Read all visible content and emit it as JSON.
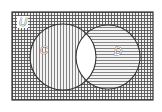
{
  "diagram": {
    "type": "venn",
    "universe_label": "U",
    "sets": [
      {
        "label": "C",
        "pattern": "vertical-lines"
      },
      {
        "label": "D",
        "pattern": "horizontal-lines"
      }
    ],
    "shading": {
      "outside_sets": "crosshatch",
      "C_only": "vertical-lines",
      "D_only": "horizontal-lines",
      "C_and_D": "unshaded"
    },
    "colors": {
      "line": "#333333",
      "background": "#ffffff"
    }
  }
}
